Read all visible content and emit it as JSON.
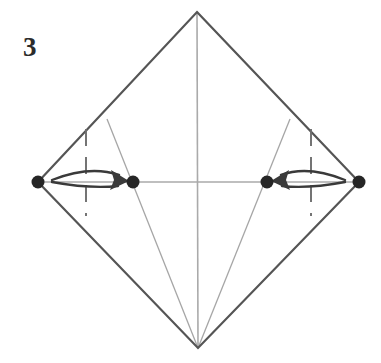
{
  "diagram": {
    "step_label": "3",
    "canvas": {
      "width": 381,
      "height": 363
    },
    "colors": {
      "background": "#ffffff",
      "outline": "#555555",
      "crease_thin": "#aaaaaa",
      "guide_dashed": "#6e6e6e",
      "arrow": "#3a3a3a",
      "vertex_dot": "#262626",
      "label_text": "#2b2b2b"
    },
    "shape": {
      "name": "square-rotated-diamond",
      "vertices": {
        "top": {
          "x": 197,
          "y": 12
        },
        "right": {
          "x": 359,
          "y": 182
        },
        "bottom": {
          "x": 198,
          "y": 348
        },
        "left": {
          "x": 38,
          "y": 182
        }
      },
      "outline_width": 2.2
    },
    "creases": [
      {
        "name": "horizontal-diagonal",
        "x1": 38,
        "y1": 182,
        "x2": 359,
        "y2": 182,
        "style": "thin-solid"
      },
      {
        "name": "vertical-diagonal",
        "x1": 197,
        "y1": 12,
        "x2": 198,
        "y2": 348,
        "style": "thin-solid"
      },
      {
        "name": "left-oblique-crease",
        "x1": 107,
        "y1": 119,
        "x2": 198,
        "y2": 348,
        "style": "thin-solid"
      },
      {
        "name": "right-oblique-crease",
        "x1": 290,
        "y1": 119,
        "x2": 198,
        "y2": 348,
        "style": "thin-solid"
      }
    ],
    "guides": [
      {
        "name": "left-fold-guide",
        "x": 86,
        "y1": 129,
        "y2": 216,
        "style": "dashed"
      },
      {
        "name": "right-fold-guide",
        "x": 311,
        "y1": 129,
        "y2": 216,
        "style": "dashed"
      }
    ],
    "dots": [
      {
        "name": "left-corner-dot",
        "x": 38,
        "y": 182,
        "r": 6.5
      },
      {
        "name": "inner-left-dot",
        "x": 133,
        "y": 182,
        "r": 6.5
      },
      {
        "name": "inner-right-dot",
        "x": 267,
        "y": 182,
        "r": 6.5
      },
      {
        "name": "right-corner-dot",
        "x": 359,
        "y": 182,
        "r": 6.5
      }
    ],
    "arrows": [
      {
        "name": "left-fold-arrow",
        "direction": "right",
        "from": {
          "x": 52,
          "y": 179
        },
        "to": {
          "x": 129,
          "y": 182
        },
        "crosses_guide": "left-fold-guide"
      },
      {
        "name": "right-fold-arrow",
        "direction": "left",
        "from": {
          "x": 345,
          "y": 179
        },
        "to": {
          "x": 271,
          "y": 182
        },
        "crosses_guide": "right-fold-guide"
      }
    ]
  }
}
